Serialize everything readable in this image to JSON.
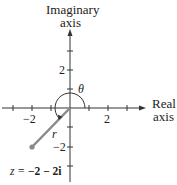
{
  "axes": {
    "imaginary_label_line1": "Imaginary",
    "imaginary_label_line2": "axis",
    "real_label_line1": "Real",
    "real_label_line2": "axis"
  },
  "ticks": {
    "x_neg": "−2",
    "x_pos": "2",
    "y_pos": "2",
    "y_neg": "−2"
  },
  "annotations": {
    "theta": "θ",
    "r": "r",
    "point_label_prefix": "z = ",
    "point_label_value": "−2 − 2i"
  },
  "colors": {
    "axis": "#333333",
    "vector": "#8a8a8a",
    "point": "#8a8a8a",
    "text": "#222222"
  },
  "point": {
    "x": -2,
    "y": -2
  }
}
